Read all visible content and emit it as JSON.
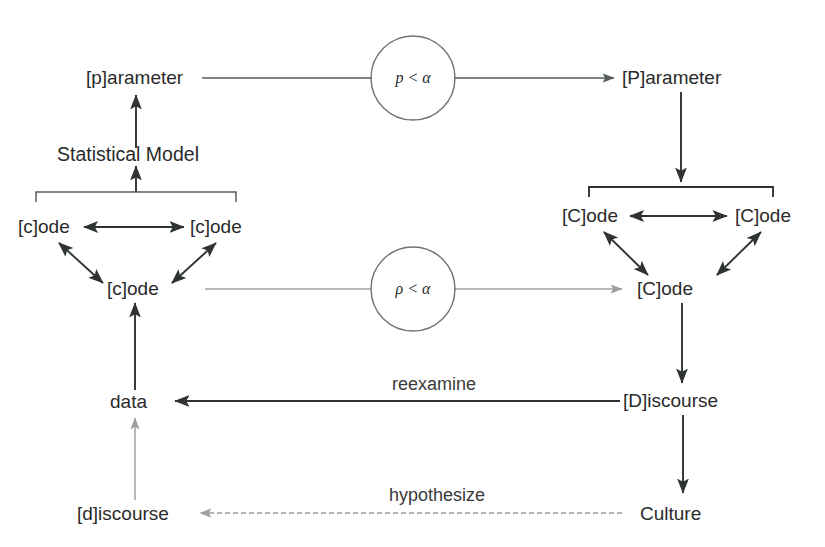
{
  "diagram": {
    "nodes": {
      "lower_parameter": "[p]arameter",
      "statistical_model": "Statistical Model",
      "lower_code_left": "[c]ode",
      "lower_code_right": "[c]ode",
      "lower_code_bottom": "[c]ode",
      "data": "data",
      "lower_discourse": "[d]iscourse",
      "upper_parameter": "[P]arameter",
      "upper_code_left": "[C]ode",
      "upper_code_right": "[C]ode",
      "upper_code_bottom": "[C]ode",
      "upper_discourse": "[D]iscourse",
      "culture": "Culture"
    },
    "gates": {
      "top_circle": "p < α",
      "bottom_circle": "ρ < α"
    },
    "edge_labels": {
      "reexamine": "reexamine",
      "hypothesize": "hypothesize"
    },
    "colors": {
      "text": "#2a2a2a",
      "line_dark": "#2f3333",
      "line_medium": "#555c5c",
      "line_light": "#9aa0a0",
      "background": "#ffffff"
    }
  }
}
